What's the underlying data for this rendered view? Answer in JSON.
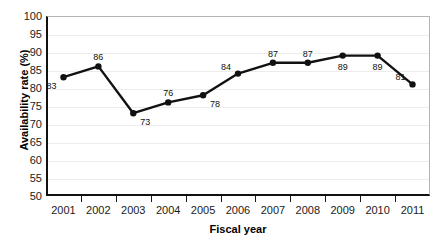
{
  "chart_data": {
    "type": "line",
    "title": "",
    "xlabel": "Fiscal year",
    "ylabel": "Availability rate (%)",
    "categories": [
      "2001",
      "2002",
      "2003",
      "2004",
      "2005",
      "2006",
      "2007",
      "2008",
      "2009",
      "2010",
      "2011"
    ],
    "values": [
      83,
      86,
      73,
      76,
      78,
      84,
      87,
      87,
      89,
      89,
      81
    ],
    "point_labels": [
      "83",
      "86",
      "73",
      "76",
      "78",
      "84",
      "87",
      "87",
      "89",
      "89",
      "81"
    ],
    "ylim": [
      50,
      100
    ],
    "ytick_step": 5,
    "yticks": [
      "100",
      "95",
      "90",
      "85",
      "80",
      "75",
      "70",
      "65",
      "60",
      "55",
      "50"
    ],
    "grid": true,
    "legend": "none",
    "series": [
      {
        "name": "Availability rate",
        "values": [
          83,
          86,
          73,
          76,
          78,
          84,
          87,
          87,
          89,
          89,
          81
        ]
      }
    ],
    "colors": {
      "line": "#111111",
      "marker": "#111111",
      "grid": "#ececec",
      "axis": "#111111",
      "frame": "#b4b4b4",
      "background": "#ffffff",
      "text": "#1a1a1a"
    },
    "label_positions": [
      "below-left",
      "above",
      "below-right",
      "above",
      "below-right",
      "above-left",
      "above",
      "above",
      "below",
      "below",
      "above-left"
    ]
  }
}
